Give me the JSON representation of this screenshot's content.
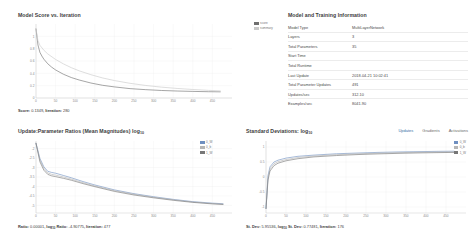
{
  "score_panel": {
    "title": "Model Score vs. Iteration",
    "status_prefix": "Score: ",
    "status_score": "0.1349",
    "status_iter_label": ", Iteration: ",
    "status_iter": "280",
    "legend": [
      {
        "label": "score",
        "color": "#6f6f6f"
      },
      {
        "label": "summary",
        "color": "#c9c9c9"
      }
    ]
  },
  "info_panel": {
    "title": "Model and Training Information",
    "rows": [
      {
        "key": "Model Type",
        "value": "MultiLayerNetwork"
      },
      {
        "key": "Layers",
        "value": "3"
      },
      {
        "key": "Total Parameters",
        "value": "35"
      },
      {
        "key": "Start Time",
        "value": ""
      },
      {
        "key": "Total Runtime",
        "value": ""
      },
      {
        "key": "Last Update",
        "value": "2018-04-21 10:02:41"
      },
      {
        "key": "Total Parameter Updates",
        "value": "491"
      },
      {
        "key": "Updates/sec",
        "value": "312.10"
      },
      {
        "key": "Examples/sec",
        "value": "8041.90"
      }
    ]
  },
  "ratio_panel": {
    "title": "Update:Parameter Ratios (Mean Magnitudes) log",
    "title_sub": "10",
    "status": [
      {
        "label": "Ratio: ",
        "value": "0.00001"
      },
      {
        "label": ", log",
        "sub": "10",
        "label2": " Ratio: ",
        "value": "-4.90775"
      },
      {
        "label": ", Iteration: ",
        "value": "477"
      }
    ],
    "legend": [
      {
        "label": "0_W",
        "color": "#6f8fc0"
      },
      {
        "label": "0_b",
        "color": "#b5b5b5"
      },
      {
        "label": "1_W",
        "color": "#777777"
      }
    ]
  },
  "stdev_panel": {
    "title": "Standard Deviations: log",
    "title_sub": "10",
    "tabs": [
      {
        "label": "Updates",
        "active": true
      },
      {
        "label": "Gradients",
        "active": false
      },
      {
        "label": "Activations",
        "active": false
      }
    ],
    "status": [
      {
        "label": "St. Dev: ",
        "value": "5.95536"
      },
      {
        "label": ", log",
        "sub": "10",
        "label2": " St. Dev: ",
        "value": "0.77481"
      },
      {
        "label": ", Iteration: ",
        "value": "176"
      }
    ],
    "legend": [
      {
        "label": "0_W",
        "color": "#6f8fc0"
      },
      {
        "label": "0_b",
        "color": "#b5b5b5"
      },
      {
        "label": "1_W",
        "color": "#777777"
      }
    ]
  },
  "chart_data": [
    {
      "id": "model-score",
      "type": "line",
      "title": "Model Score vs. Iteration",
      "xlabel": "Iteration",
      "ylabel": "Score",
      "xlim": [
        0,
        500
      ],
      "ylim": [
        0.0,
        1.2
      ],
      "xticks": [
        0,
        50,
        100,
        150,
        200,
        250,
        300,
        350,
        400,
        450
      ],
      "yticks": [
        0.0,
        0.2,
        0.4,
        0.6,
        0.8,
        1.0
      ],
      "grid": true,
      "legend_position": "top-right",
      "current_point": {
        "iteration": 280,
        "score": 0.1349
      },
      "series": [
        {
          "name": "score",
          "color": "#6f6f6f",
          "x": [
            0,
            5,
            10,
            15,
            20,
            30,
            40,
            50,
            70,
            90,
            110,
            140,
            170,
            200,
            240,
            280,
            320,
            360,
            400,
            440,
            470
          ],
          "y": [
            1.12,
            0.86,
            0.74,
            0.68,
            0.63,
            0.555,
            0.5,
            0.455,
            0.385,
            0.332,
            0.292,
            0.243,
            0.206,
            0.18,
            0.152,
            0.135,
            0.122,
            0.113,
            0.107,
            0.102,
            0.1
          ]
        },
        {
          "name": "summary",
          "color": "#c9c9c9",
          "x": [
            0,
            5,
            10,
            20,
            30,
            50,
            70,
            90,
            110,
            140,
            170,
            200,
            240,
            280,
            320,
            360,
            400,
            440,
            470
          ],
          "y": [
            1.12,
            0.93,
            0.855,
            0.775,
            0.715,
            0.625,
            0.553,
            0.492,
            0.441,
            0.378,
            0.325,
            0.283,
            0.238,
            0.203,
            0.176,
            0.155,
            0.138,
            0.124,
            0.116
          ]
        }
      ]
    },
    {
      "id": "update-parameter-ratios",
      "type": "line",
      "title": "Update:Parameter Ratios (Mean Magnitudes) log10",
      "xlabel": "Iteration",
      "ylabel": "log10 Ratio",
      "xlim": [
        0,
        500
      ],
      "ylim": [
        -5.4,
        -1.6
      ],
      "xticks": [
        0,
        50,
        100,
        150,
        200,
        250,
        300,
        350,
        400,
        450
      ],
      "yticks": [
        -5.0,
        -4.5,
        -4.0,
        -3.5,
        -3.0,
        -2.5,
        -2.0
      ],
      "grid": true,
      "legend_position": "top-right",
      "current_point": {
        "iteration": 477,
        "ratio": 1e-05,
        "log10_ratio": -4.90775
      },
      "series": [
        {
          "name": "0_W",
          "color": "#6f8fc0",
          "x": [
            0,
            10,
            20,
            30,
            40,
            50,
            70,
            90,
            120,
            150,
            200,
            250,
            300,
            350,
            400,
            450,
            477
          ],
          "y": [
            -1.72,
            -2.52,
            -2.96,
            -3.2,
            -3.26,
            -3.3,
            -3.42,
            -3.54,
            -3.74,
            -3.92,
            -4.18,
            -4.38,
            -4.54,
            -4.68,
            -4.8,
            -4.88,
            -4.91
          ]
        },
        {
          "name": "0_b",
          "color": "#b5b5b5",
          "x": [
            0,
            10,
            20,
            30,
            40,
            50,
            70,
            90,
            120,
            150,
            200,
            250,
            300,
            350,
            400,
            450,
            477
          ],
          "y": [
            -1.72,
            -2.6,
            -3.04,
            -3.28,
            -3.36,
            -3.4,
            -3.5,
            -3.61,
            -3.8,
            -3.97,
            -4.22,
            -4.41,
            -4.57,
            -4.7,
            -4.82,
            -4.9,
            -4.93
          ]
        },
        {
          "name": "1_W",
          "color": "#777777",
          "x": [
            0,
            10,
            20,
            30,
            40,
            50,
            70,
            90,
            120,
            150,
            200,
            250,
            300,
            350,
            400,
            450,
            477
          ],
          "y": [
            -1.72,
            -2.7,
            -3.14,
            -3.36,
            -3.44,
            -3.48,
            -3.57,
            -3.67,
            -3.85,
            -4.01,
            -4.26,
            -4.45,
            -4.6,
            -4.73,
            -4.84,
            -4.92,
            -4.95
          ]
        }
      ]
    },
    {
      "id": "standard-deviations",
      "type": "line",
      "title": "Standard Deviations: log10",
      "xlabel": "Iteration",
      "ylabel": "log10 St. Dev",
      "xlim": [
        0,
        500
      ],
      "ylim": [
        -1.2,
        1.2
      ],
      "xticks": [
        0,
        50,
        100,
        150,
        200,
        250,
        300,
        350,
        400,
        450
      ],
      "yticks": [
        -1.0,
        -0.5,
        0.0,
        0.5,
        1.0
      ],
      "grid": true,
      "legend_position": "top-right",
      "current_point": {
        "iteration": 176,
        "st_dev": 5.95536,
        "log10_st_dev": 0.77481
      },
      "series": [
        {
          "name": "0_W",
          "color": "#6f8fc0",
          "x": [
            0,
            5,
            10,
            20,
            30,
            50,
            80,
            120,
            176,
            230,
            280,
            330,
            380,
            430,
            470
          ],
          "y": [
            -1.05,
            0.05,
            0.34,
            0.5,
            0.56,
            0.63,
            0.69,
            0.73,
            0.775,
            0.8,
            0.82,
            0.835,
            0.845,
            0.855,
            0.86
          ]
        },
        {
          "name": "0_b",
          "color": "#b5b5b5",
          "x": [
            0,
            5,
            10,
            20,
            30,
            50,
            80,
            120,
            176,
            230,
            280,
            330,
            380,
            430,
            470
          ],
          "y": [
            -1.05,
            -0.02,
            0.27,
            0.44,
            0.51,
            0.58,
            0.65,
            0.7,
            0.745,
            0.775,
            0.795,
            0.812,
            0.824,
            0.834,
            0.84
          ]
        },
        {
          "name": "1_W",
          "color": "#777777",
          "x": [
            0,
            5,
            10,
            20,
            30,
            50,
            80,
            120,
            176,
            230,
            280,
            330,
            380,
            430,
            470
          ],
          "y": [
            -1.05,
            -0.1,
            0.2,
            0.38,
            0.46,
            0.54,
            0.61,
            0.67,
            0.715,
            0.748,
            0.77,
            0.788,
            0.802,
            0.813,
            0.82
          ]
        }
      ]
    }
  ]
}
